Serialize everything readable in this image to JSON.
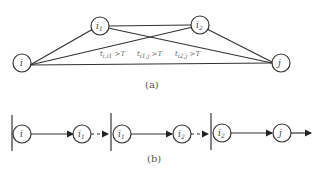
{
  "diagram_a": {
    "caption": "(a)",
    "nodes": [
      {
        "id": "i",
        "label": "i",
        "sub": ""
      },
      {
        "id": "i1",
        "label": "i",
        "sub": "1"
      },
      {
        "id": "i2",
        "label": "i",
        "sub": "2"
      },
      {
        "id": "j",
        "label": "j",
        "sub": ""
      }
    ],
    "conditions": [
      {
        "t": "t",
        "sub": "i,i1",
        "rest": " >T"
      },
      {
        "t": "t",
        "sub": "i1,j",
        "rest": " >T"
      },
      {
        "t": "t",
        "sub": "i2,j",
        "rest": " >T"
      }
    ]
  },
  "diagram_b": {
    "caption": "(b)",
    "nodes": [
      {
        "label": "i",
        "sub": ""
      },
      {
        "label": "i",
        "sub": "1"
      },
      {
        "label": "i",
        "sub": "1"
      },
      {
        "label": "i",
        "sub": "2"
      },
      {
        "label": "i",
        "sub": "2"
      },
      {
        "label": "j",
        "sub": ""
      }
    ]
  }
}
